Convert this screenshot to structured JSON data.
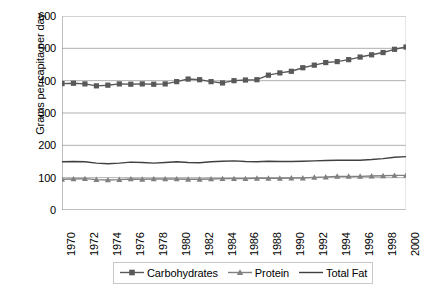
{
  "chart_data": {
    "type": "line",
    "title": "",
    "xlabel": "",
    "ylabel": "Grams per capita per day",
    "xlim": [
      1970,
      2000
    ],
    "ylim": [
      0,
      600
    ],
    "ytick_values": [
      0,
      100,
      200,
      300,
      400,
      500,
      600
    ],
    "ytick_labels": [
      "0",
      "100",
      "200",
      "300",
      "400",
      "500",
      "600"
    ],
    "xtick_labels": [
      "1970",
      "1972",
      "1974",
      "1976",
      "1978",
      "1980",
      "1982",
      "1984",
      "1986",
      "1988",
      "1990",
      "1992",
      "1994",
      "1996",
      "1998",
      "2000"
    ],
    "x": [
      1970,
      1971,
      1972,
      1973,
      1974,
      1975,
      1976,
      1977,
      1978,
      1979,
      1980,
      1981,
      1982,
      1983,
      1984,
      1985,
      1986,
      1987,
      1988,
      1989,
      1990,
      1991,
      1992,
      1993,
      1994,
      1995,
      1996,
      1997,
      1998,
      1999,
      2000
    ],
    "grid": "horizontal",
    "legend_position": "bottom",
    "series": [
      {
        "name": "Carbohydrates",
        "marker": "square",
        "color": "#595959",
        "values": [
          391,
          392,
          390,
          384,
          386,
          390,
          389,
          390,
          389,
          390,
          397,
          405,
          403,
          397,
          393,
          400,
          402,
          403,
          417,
          424,
          429,
          440,
          448,
          456,
          459,
          465,
          473,
          480,
          487,
          497,
          504
        ]
      },
      {
        "name": "Protein",
        "marker": "triangle",
        "color": "#808080",
        "values": [
          95,
          96,
          97,
          94,
          93,
          94,
          96,
          95,
          96,
          96,
          96,
          95,
          95,
          96,
          97,
          97,
          97,
          98,
          98,
          98,
          99,
          99,
          101,
          102,
          104,
          104,
          104,
          105,
          106,
          107,
          107
        ]
      },
      {
        "name": "Total Fat",
        "marker": "none",
        "color": "#404040",
        "values": [
          149,
          150,
          149,
          145,
          143,
          145,
          148,
          147,
          145,
          147,
          149,
          147,
          146,
          149,
          151,
          152,
          150,
          149,
          151,
          150,
          150,
          151,
          152,
          153,
          154,
          154,
          154,
          156,
          159,
          163,
          165
        ]
      }
    ]
  },
  "legend": {
    "items": [
      {
        "label": "Carbohydrates"
      },
      {
        "label": "Protein"
      },
      {
        "label": "Total Fat"
      }
    ]
  },
  "axes": {
    "y_title": "Grams per capita per day"
  }
}
